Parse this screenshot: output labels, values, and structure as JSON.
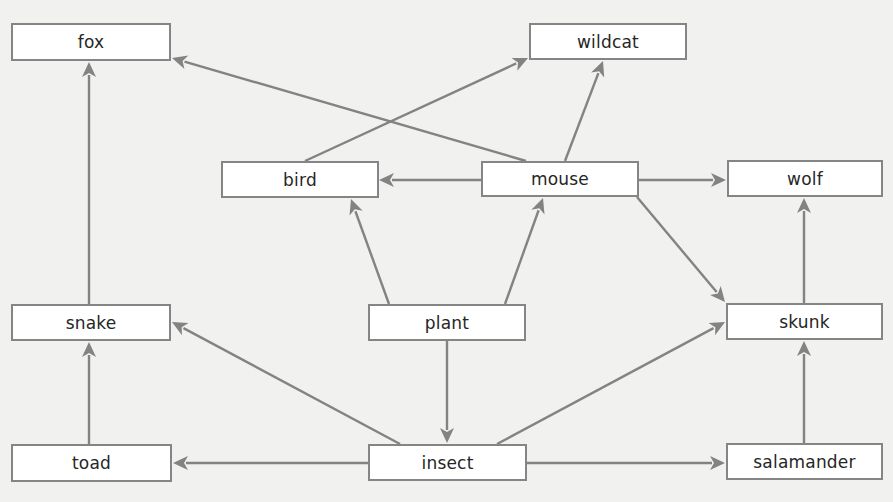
{
  "diagram": {
    "title": "",
    "colors": {
      "background": "#f1f1f0",
      "box_fill": "#ffffff",
      "box_border": "#858585",
      "edge": "#838383",
      "text": "#262626"
    },
    "nodes": [
      {
        "id": "fox",
        "label": "fox",
        "x": 11,
        "y": 23,
        "w": 160,
        "h": 38
      },
      {
        "id": "wildcat",
        "label": "wildcat",
        "x": 529,
        "y": 23,
        "w": 158,
        "h": 37
      },
      {
        "id": "bird",
        "label": "bird",
        "x": 221,
        "y": 161,
        "w": 158,
        "h": 37
      },
      {
        "id": "mouse",
        "label": "mouse",
        "x": 481,
        "y": 161,
        "w": 158,
        "h": 36
      },
      {
        "id": "wolf",
        "label": "wolf",
        "x": 727,
        "y": 160,
        "w": 156,
        "h": 37
      },
      {
        "id": "snake",
        "label": "snake",
        "x": 11,
        "y": 304,
        "w": 160,
        "h": 37
      },
      {
        "id": "plant",
        "label": "plant",
        "x": 368,
        "y": 304,
        "w": 158,
        "h": 37
      },
      {
        "id": "skunk",
        "label": "skunk",
        "x": 726,
        "y": 303,
        "w": 157,
        "h": 37
      },
      {
        "id": "toad",
        "label": "toad",
        "x": 11,
        "y": 444,
        "w": 161,
        "h": 38
      },
      {
        "id": "insect",
        "label": "insect",
        "x": 368,
        "y": 444,
        "w": 159,
        "h": 37
      },
      {
        "id": "salamander",
        "label": "salamander",
        "x": 726,
        "y": 443,
        "w": 157,
        "h": 37
      }
    ],
    "edges": [
      {
        "from": "mouse",
        "to": "fox",
        "x1": 526,
        "y1": 161,
        "x2": 172,
        "y2": 58
      },
      {
        "from": "bird",
        "to": "wildcat",
        "x1": 305,
        "y1": 161,
        "x2": 528,
        "y2": 58
      },
      {
        "from": "mouse",
        "to": "wildcat",
        "x1": 565,
        "y1": 161,
        "x2": 603,
        "y2": 61
      },
      {
        "from": "mouse",
        "to": "bird",
        "x1": 481,
        "y1": 180,
        "x2": 379,
        "y2": 180
      },
      {
        "from": "mouse",
        "to": "wolf",
        "x1": 639,
        "y1": 180,
        "x2": 726,
        "y2": 180
      },
      {
        "from": "mouse",
        "to": "skunk",
        "x1": 637,
        "y1": 197,
        "x2": 725,
        "y2": 302
      },
      {
        "from": "plant",
        "to": "bird",
        "x1": 389,
        "y1": 304,
        "x2": 351,
        "y2": 199
      },
      {
        "from": "plant",
        "to": "mouse",
        "x1": 505,
        "y1": 304,
        "x2": 543,
        "y2": 198
      },
      {
        "from": "snake",
        "to": "fox",
        "x1": 89,
        "y1": 304,
        "x2": 89,
        "y2": 62
      },
      {
        "from": "skunk",
        "to": "wolf",
        "x1": 804,
        "y1": 303,
        "x2": 804,
        "y2": 198
      },
      {
        "from": "plant",
        "to": "insect",
        "x1": 447,
        "y1": 341,
        "x2": 447,
        "y2": 443
      },
      {
        "from": "insect",
        "to": "snake",
        "x1": 400,
        "y1": 444,
        "x2": 172,
        "y2": 322
      },
      {
        "from": "insect",
        "to": "skunk",
        "x1": 497,
        "y1": 444,
        "x2": 725,
        "y2": 322
      },
      {
        "from": "toad",
        "to": "snake",
        "x1": 89,
        "y1": 444,
        "x2": 89,
        "y2": 342
      },
      {
        "from": "insect",
        "to": "toad",
        "x1": 368,
        "y1": 463,
        "x2": 173,
        "y2": 463
      },
      {
        "from": "insect",
        "to": "salamander",
        "x1": 527,
        "y1": 463,
        "x2": 725,
        "y2": 463
      },
      {
        "from": "salamander",
        "to": "skunk",
        "x1": 804,
        "y1": 443,
        "x2": 804,
        "y2": 341
      }
    ]
  }
}
